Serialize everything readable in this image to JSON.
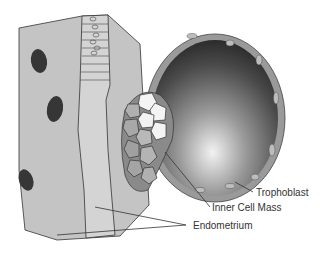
{
  "diagram": {
    "type": "anatomical illustration",
    "labels": [
      {
        "id": "trophoblast",
        "text": "Trophoblast"
      },
      {
        "id": "inner-cell-mass",
        "text": "Inner Cell Mass"
      },
      {
        "id": "endometrium",
        "text": "Endometrium"
      }
    ],
    "colors": {
      "tissue": "#c4c4c4",
      "gland_lining": "#d6d6d6",
      "nuclei": "#3a3a3a",
      "blastocoel_dark": "#2a2a2a",
      "blastocoel_light": "#e6e6e6",
      "trophoblast_layer": "#9c9c9c",
      "inner_cells": "#f4f4f4",
      "outline": "#333333"
    }
  }
}
